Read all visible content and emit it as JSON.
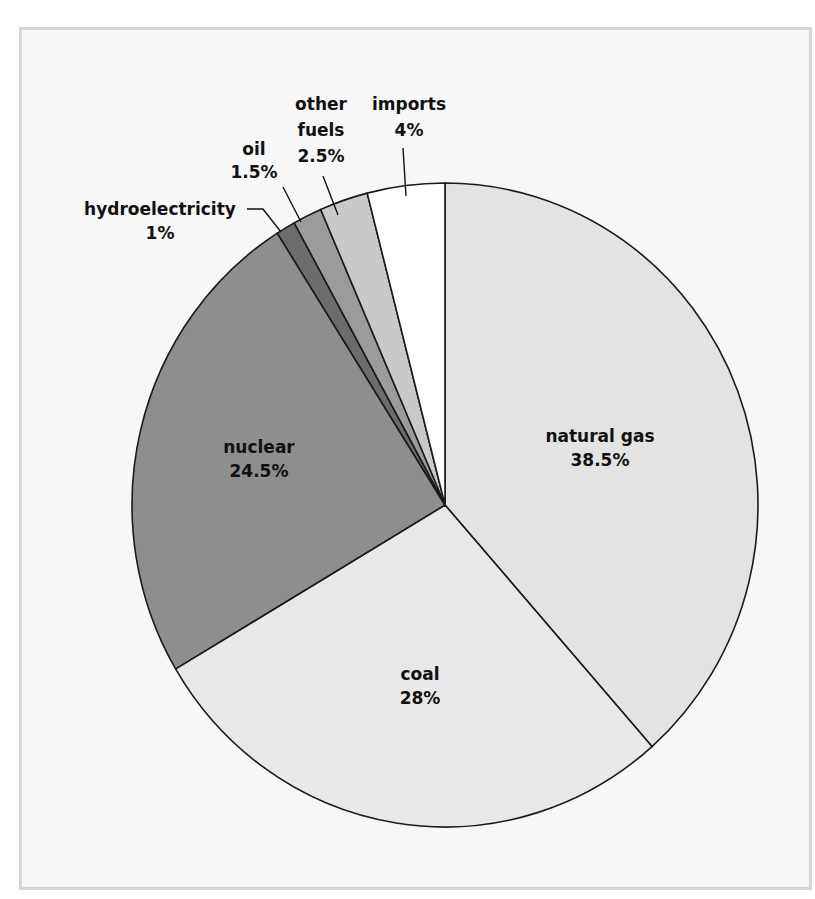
{
  "chart_data": {
    "type": "pie",
    "title": "",
    "start_angle_deg": 0,
    "direction": "clockwise",
    "slices": [
      {
        "label": "natural gas",
        "value": 38.5,
        "display": "38.5%",
        "color": "#e3e3e3"
      },
      {
        "label": "coal",
        "value": 28,
        "display": "28%",
        "color": "#e8e8e8"
      },
      {
        "label": "nuclear",
        "value": 24.5,
        "display": "24.5%",
        "color": "#8e8e8e"
      },
      {
        "label": "hydroelectricity",
        "value": 1,
        "display": "1%",
        "color": "#6c6c6c"
      },
      {
        "label": "oil",
        "value": 1.5,
        "display": "1.5%",
        "color": "#9b9b9b"
      },
      {
        "label": "other fuels",
        "value": 2.5,
        "display": "2.5%",
        "color": "#c9c9c9"
      },
      {
        "label": "imports",
        "value": 4,
        "display": "4%",
        "color": "#ffffff"
      }
    ],
    "legend": "none (labels placed on/near slices)"
  },
  "labels": {
    "natural_gas": {
      "name": "natural gas",
      "pct": "38.5%"
    },
    "coal": {
      "name": "coal",
      "pct": "28%"
    },
    "nuclear": {
      "name": "nuclear",
      "pct": "24.5%"
    },
    "hydro": {
      "name": "hydroelectricity",
      "pct": "1%"
    },
    "oil": {
      "name": "oil",
      "pct": "1.5%"
    },
    "other_fuels": {
      "name_line1": "other",
      "name_line2": "fuels",
      "pct": "2.5%"
    },
    "imports": {
      "name": "imports",
      "pct": "4%"
    }
  }
}
